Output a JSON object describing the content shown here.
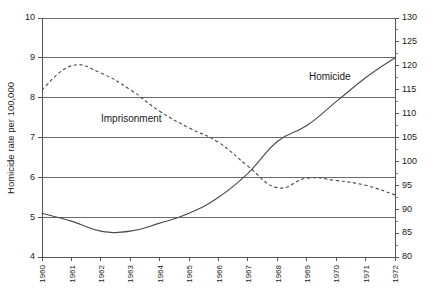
{
  "chart_data": {
    "type": "line",
    "title": "",
    "xlabel": "",
    "ylabel": "Homicide rate per 100,000",
    "ylabel_right": "",
    "x": [
      1960,
      1961,
      1962,
      1963,
      1964,
      1965,
      1966,
      1967,
      1968,
      1969,
      1970,
      1971,
      1972
    ],
    "xtick_labels": [
      "1960",
      "1961",
      "1962",
      "1963",
      "1964",
      "1965",
      "1966",
      "1967",
      "1968",
      "1969",
      "1970",
      "1971",
      "1972"
    ],
    "ylim": [
      4,
      10
    ],
    "ytick_labels": [
      "4",
      "5",
      "6",
      "7",
      "8",
      "9",
      "10"
    ],
    "ytick_values": [
      4,
      5,
      6,
      7,
      8,
      9,
      10
    ],
    "ylim_right": [
      80,
      130
    ],
    "ytick_labels_right": [
      "80",
      "85",
      "90",
      "95",
      "100",
      "105",
      "110",
      "115",
      "120",
      "125",
      "130"
    ],
    "ytick_values_right": [
      80,
      85,
      90,
      95,
      100,
      105,
      110,
      115,
      120,
      125,
      130
    ],
    "grid": true,
    "legend_position": "inline-annotation",
    "series": [
      {
        "name": "Homicide",
        "style": "solid",
        "axis": "left",
        "color": "#4a4a4a",
        "values": [
          5.1,
          4.9,
          4.65,
          4.65,
          4.85,
          5.1,
          5.5,
          6.1,
          6.9,
          7.3,
          7.9,
          8.5,
          9.0
        ]
      },
      {
        "name": "Imprisonment",
        "style": "dashed",
        "axis": "right",
        "color": "#4a4a4a",
        "values": [
          115.0,
          120.0,
          118.5,
          115.0,
          110.5,
          107.0,
          104.0,
          99.0,
          94.5,
          96.5,
          96.0,
          95.0,
          93.0
        ]
      }
    ],
    "annotations": [
      {
        "text": "Imprisonment",
        "x_px": 101,
        "y_px": 122
      },
      {
        "text": "Homicide",
        "x_px": 309,
        "y_px": 80
      }
    ]
  }
}
